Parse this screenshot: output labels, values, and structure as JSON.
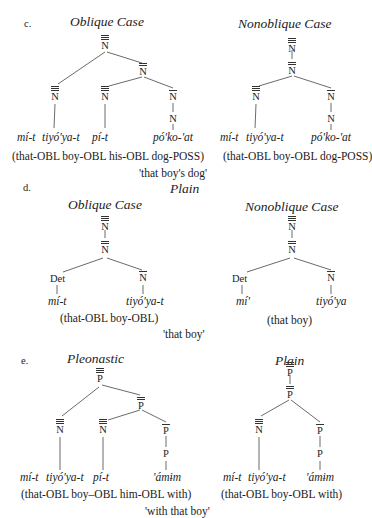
{
  "sections": {
    "c": {
      "letter": "c.",
      "left_title": "Oblique Case",
      "right_title": "Nonoblique Case",
      "left_words": [
        "mí-t",
        "tiyó'ya-t",
        "pí-t",
        "pó'ko-'at"
      ],
      "right_words": [
        "mí-t",
        "tiyó'ya-t",
        "pó'ko-'at"
      ],
      "left_gloss": "(that-OBL boy-OBL his-OBL dog-POSS)",
      "right_gloss": "(that-OBL boy-OBL dog-POSS)",
      "translation": "'that boy's dog'"
    },
    "d": {
      "letter": "d.",
      "heading": "Plain",
      "left_title": "Oblique Case",
      "right_title": "Nonoblique Case",
      "det_label": "Det",
      "left_words": [
        "mí-t",
        "tiyó'ya-t"
      ],
      "right_words": [
        "mí'",
        "tiyó'ya"
      ],
      "left_gloss": "(that-OBL boy-OBL)",
      "right_gloss": "(that boy)",
      "translation": "'that boy'"
    },
    "e": {
      "letter": "e.",
      "left_title": "Pleonastic",
      "right_title": "Plain",
      "left_words": [
        "mí-t",
        "tiyó'ya-t",
        "pí-t",
        "'ámɨm"
      ],
      "right_words": [
        "mí-t",
        "tiyó'ya-t",
        "'ámɨm"
      ],
      "left_gloss": "(that-OBL boy–OBL him-OBL with)",
      "right_gloss": "(that-OBL boy-OBL with)",
      "translation": "'with that boy'"
    }
  },
  "node_labels": {
    "N": "N",
    "P": "P"
  }
}
